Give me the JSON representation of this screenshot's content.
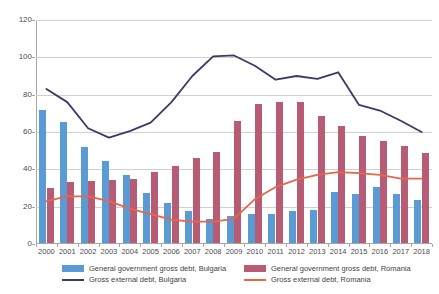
{
  "chart_data": {
    "type": "bar",
    "title": "",
    "subtitle": "",
    "xlabel": "",
    "ylabel": "",
    "ylim": [
      0,
      120
    ],
    "ytick_step": 20,
    "yticks": [
      0,
      20,
      40,
      60,
      80,
      100,
      120
    ],
    "grid": true,
    "legend_position": "bottom",
    "categories": [
      "2000",
      "2001",
      "2002",
      "2003",
      "2004",
      "2005",
      "2006",
      "2007",
      "2008",
      "2009",
      "2010",
      "2011",
      "2012",
      "2013",
      "2014",
      "2015",
      "2016",
      "2017",
      "2018"
    ],
    "series": [
      {
        "name": "General government gross debt, Bulgaria",
        "kind": "bar",
        "color": "#5B9BD5",
        "values": [
          71.5,
          65.0,
          51.5,
          44.0,
          36.5,
          27.0,
          21.5,
          17.0,
          13.0,
          14.5,
          15.5,
          15.5,
          17.0,
          17.5,
          27.5,
          26.5,
          30.0,
          26.0,
          23.0
        ]
      },
      {
        "name": "General government gross debt, Romania",
        "kind": "bar",
        "color": "#B85C75",
        "values": [
          29.5,
          32.5,
          33.0,
          33.5,
          34.5,
          38.0,
          41.5,
          45.5,
          49.0,
          65.5,
          74.5,
          75.5,
          75.5,
          68.0,
          62.5,
          57.5,
          54.5,
          52.0,
          48.0
        ]
      },
      {
        "name": "Gross external debt, Bulgaria",
        "kind": "line",
        "color": "#3A3A6B",
        "values": [
          83.0,
          76.0,
          62.0,
          57.0,
          60.5,
          65.0,
          76.0,
          90.0,
          100.5,
          101.0,
          95.5,
          88.0,
          90.0,
          88.5,
          92.0,
          74.5,
          71.5,
          66.0,
          60.0
        ]
      },
      {
        "name": "Gross external debt, Romania",
        "kind": "line",
        "color": "#E8654A",
        "values": [
          23.0,
          25.5,
          25.5,
          23.0,
          19.0,
          16.0,
          13.0,
          12.0,
          12.0,
          13.5,
          24.0,
          30.5,
          34.5,
          37.0,
          38.5,
          38.0,
          37.0,
          35.0,
          35.0
        ]
      }
    ],
    "legend": [
      {
        "label": "General government gross debt, Bulgaria",
        "marker": "bar",
        "color": "#5B9BD5"
      },
      {
        "label": "General government gross debt, Romania",
        "marker": "bar",
        "color": "#B85C75"
      },
      {
        "label": "Gross external debt, Bulgaria",
        "marker": "line",
        "color": "#3A3A6B"
      },
      {
        "label": "Gross external debt, Romania",
        "marker": "line",
        "color": "#E8654A"
      }
    ]
  }
}
